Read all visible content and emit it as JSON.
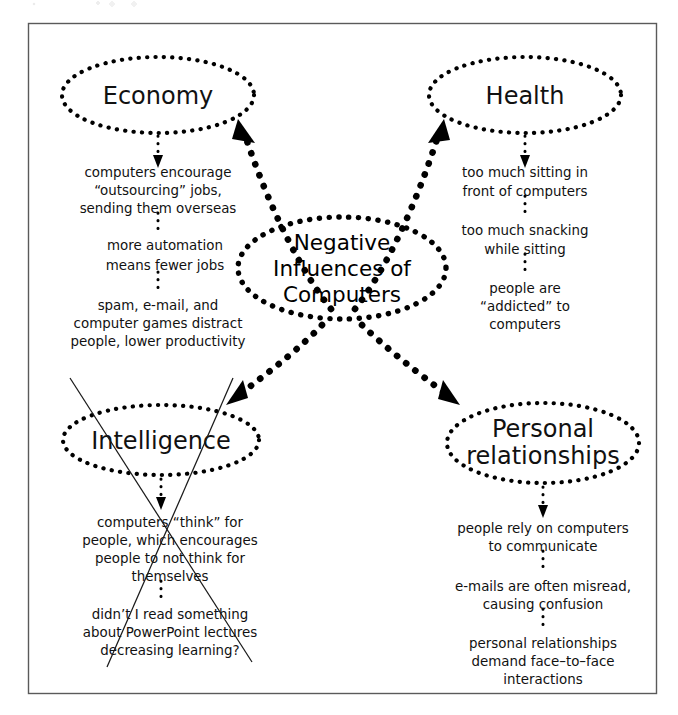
{
  "diagram": {
    "center": {
      "id": "center-node",
      "label_lines": [
        "Negative",
        "Influences of",
        "Computers"
      ]
    },
    "branches": [
      {
        "id": "economy",
        "label": "Economy",
        "notes": [
          {
            "lines": [
              "computers encourage",
              "“outsourcing” jobs,",
              "sending them overseas"
            ]
          },
          {
            "lines": [
              "more automation",
              "means fewer jobs"
            ]
          },
          {
            "lines": [
              "spam, e-mail, and",
              "computer games distract",
              "people, lower productivity"
            ]
          }
        ]
      },
      {
        "id": "health",
        "label": "Health",
        "notes": [
          {
            "lines": [
              "too much sitting in",
              "front of computers"
            ]
          },
          {
            "lines": [
              "too much snacking",
              "while sitting"
            ]
          },
          {
            "lines": [
              "people are",
              "“addicted” to",
              "computers"
            ]
          }
        ]
      },
      {
        "id": "intelligence",
        "label": "Intelligence",
        "struck_through": true,
        "notes": [
          {
            "lines": [
              "computers “think” for",
              "people, which encourages",
              "people to not think for",
              "themselves"
            ]
          },
          {
            "lines": [
              "didn’t I read something",
              "about PowerPoint lectures",
              "decreasing learning?"
            ]
          }
        ]
      },
      {
        "id": "personal-relationships",
        "label_lines": [
          "Personal",
          "relationships"
        ],
        "notes": [
          {
            "lines": [
              "people rely on computers",
              "to communicate"
            ]
          },
          {
            "lines": [
              "e-mails are often misread,",
              "causing confusion"
            ]
          },
          {
            "lines": [
              "personal relationships",
              "demand face–to–face",
              "interactions"
            ]
          }
        ]
      }
    ],
    "colors": {
      "ink": "#000000",
      "frame": "#5a5a5a",
      "paper": "#ffffff",
      "strike": "#1a1a1a"
    }
  }
}
